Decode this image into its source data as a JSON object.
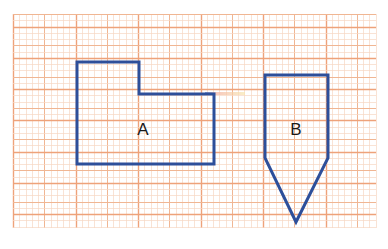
{
  "diagram": {
    "title": "",
    "background": "#ffffff",
    "grid": {
      "x0": 13,
      "y0": 14,
      "x1": 376,
      "y1": 228,
      "minor_spacing": 6.25,
      "medium_spacing": 31.25,
      "colors": {
        "minor": "#f6d7c3",
        "medium": "#f0b693",
        "major": "#eea27a"
      }
    },
    "shapes": [
      {
        "id": "A",
        "label": "A",
        "type": "polygon",
        "stroke": "#2d4f9a",
        "points": [
          [
            77,
            62
          ],
          [
            139,
            62
          ],
          [
            139,
            94
          ],
          [
            214,
            94
          ],
          [
            214,
            164
          ],
          [
            77,
            164
          ]
        ],
        "label_pos": [
          143,
          131
        ]
      },
      {
        "id": "B",
        "label": "B",
        "type": "polygon",
        "stroke": "#2d4f9a",
        "points": [
          [
            265,
            75
          ],
          [
            328,
            75
          ],
          [
            328,
            158
          ],
          [
            296,
            222
          ],
          [
            265,
            158
          ]
        ],
        "label_pos": [
          296,
          131
        ]
      }
    ],
    "artifact": {
      "description": "faint colored smudge",
      "x": 205,
      "y": 92,
      "width": 40,
      "height": 3
    }
  }
}
